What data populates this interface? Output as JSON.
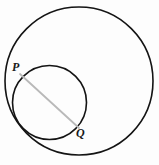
{
  "figure": {
    "type": "geometry-diagram",
    "canvas": {
      "width": 159,
      "height": 165,
      "background": "#fdfdfd"
    },
    "shapes": {
      "large_circle": {
        "name": "large-circle",
        "cx": 79,
        "cy": 81,
        "r": 74,
        "stroke": "#141414",
        "stroke_width": 1.6,
        "fill": "none"
      },
      "small_circle": {
        "name": "small-circle",
        "cx": 49.5,
        "cy": 102.5,
        "r": 37,
        "stroke": "#141414",
        "stroke_width": 1.6,
        "fill": "none"
      },
      "segment_pq": {
        "name": "segment-pq",
        "x1": 20,
        "y1": 74,
        "x2": 79,
        "y2": 128,
        "stroke": "#b9b9b9",
        "stroke_width": 1.8
      }
    },
    "labels": {
      "p": "P",
      "q": "Q"
    },
    "colors": {
      "stroke": "#141414",
      "segment": "#b9b9b9",
      "label": "#1a1a1a",
      "background": "#fdfdfd"
    }
  }
}
